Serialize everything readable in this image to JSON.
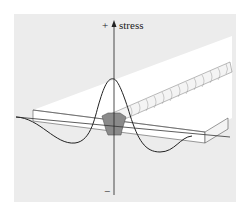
{
  "diagram": {
    "axis_label": "stress",
    "positive_sign": "+",
    "negative_sign": "−",
    "colors": {
      "background_panel": "#ececec",
      "plate": "#ffffff",
      "weld_fill": "#8a8a8a",
      "line": "#333333"
    }
  }
}
